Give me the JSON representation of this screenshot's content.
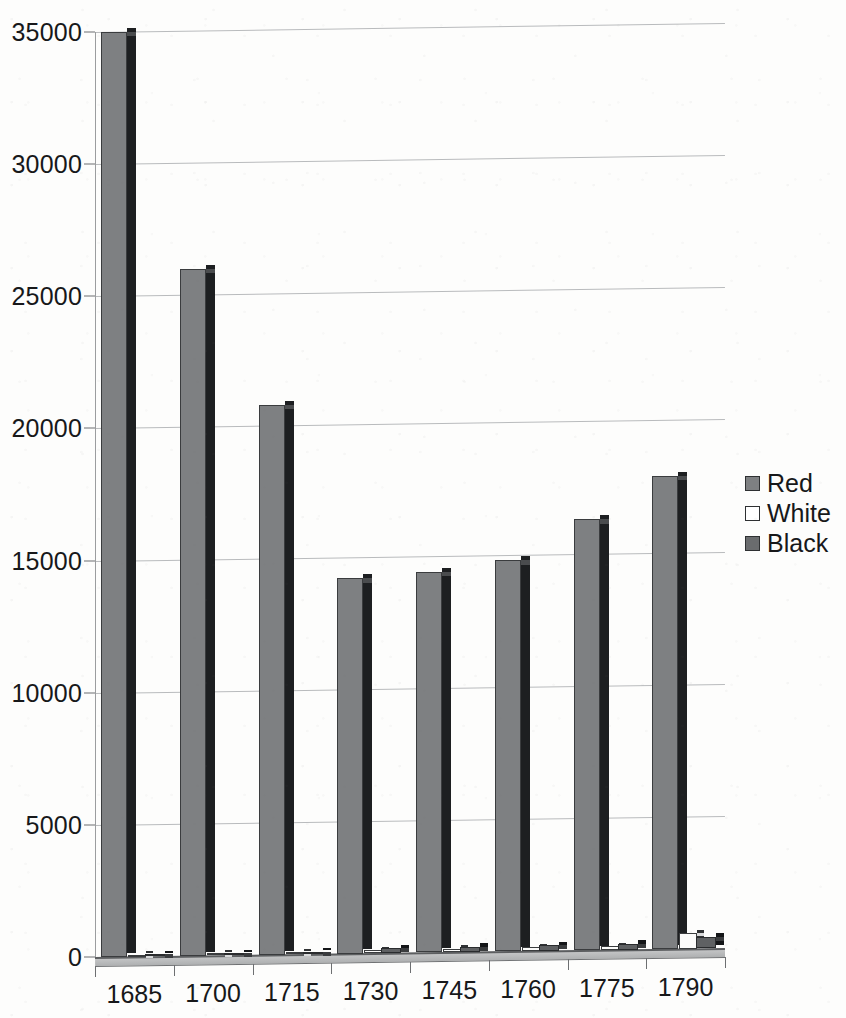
{
  "chart_data": {
    "type": "bar",
    "title": "",
    "xlabel": "",
    "ylabel": "",
    "categories": [
      "1685",
      "1700",
      "1715",
      "1730",
      "1745",
      "1760",
      "1775",
      "1790"
    ],
    "ylim": [
      0,
      35000
    ],
    "yticks": [
      0,
      5000,
      10000,
      15000,
      20000,
      25000,
      30000,
      35000
    ],
    "ytick_labels": [
      "0",
      "5000",
      "10000",
      "15000",
      "20000",
      "25000",
      "30000",
      "35000"
    ],
    "grid": true,
    "legend_position": "right",
    "style": "3d-column",
    "series": [
      {
        "name": "Red",
        "color": "#7e8082",
        "values": [
          35000,
          26000,
          20800,
          14200,
          14400,
          14800,
          16300,
          17900
        ]
      },
      {
        "name": "White",
        "color": "#ffffff",
        "values": [
          40,
          50,
          60,
          120,
          130,
          140,
          150,
          600
        ]
      },
      {
        "name": "Black",
        "color": "#6a6c6e",
        "values": [
          60,
          70,
          90,
          180,
          190,
          200,
          210,
          450
        ]
      }
    ]
  },
  "legend": {
    "items": [
      {
        "label": "Red",
        "swatch": "filled"
      },
      {
        "label": "White",
        "swatch": "empty"
      },
      {
        "label": "Black",
        "swatch": "filled"
      }
    ]
  },
  "colors": {
    "bar_face": "#7e8082",
    "bar_side": "#1d1f21",
    "gridline": "#b9bbbd",
    "axis": "#5c5e60",
    "text": "#17181a",
    "background": "#fdfdfc"
  }
}
